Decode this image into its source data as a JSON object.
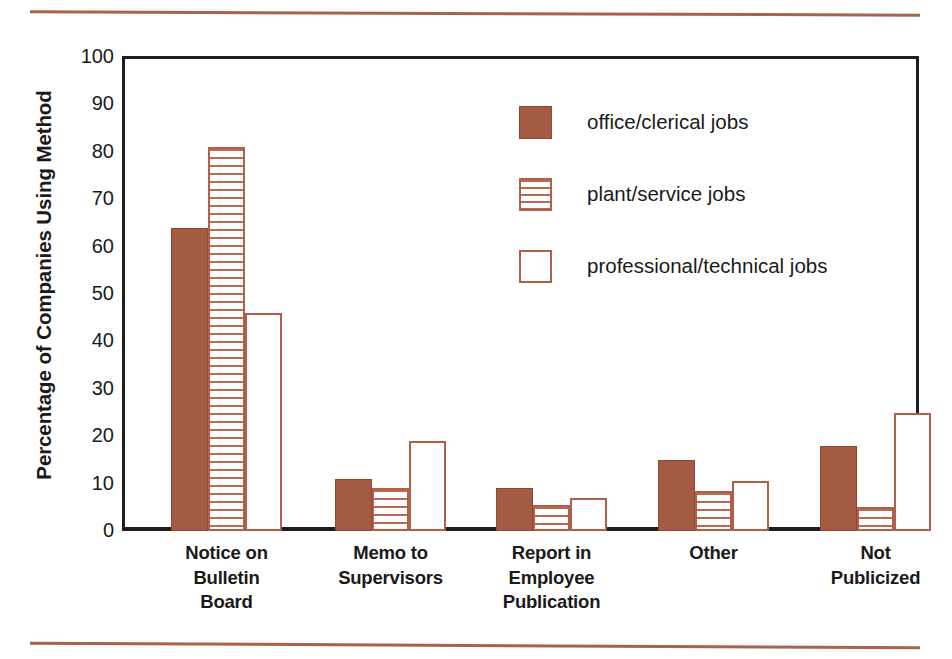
{
  "chart_data": {
    "type": "bar",
    "title": "",
    "xlabel": "",
    "ylabel": "Percentage of Companies Using Method",
    "ylim": [
      0,
      100
    ],
    "yticks": [
      0,
      10,
      20,
      30,
      40,
      50,
      60,
      70,
      80,
      90,
      100
    ],
    "grid": false,
    "legend_position": "inside-top-center",
    "categories": [
      "Notice on Bulletin Board",
      "Memo to Supervisors",
      "Report in Employee Publication",
      "Other",
      "Not Publicized"
    ],
    "category_lines": [
      [
        "Notice on",
        "Bulletin",
        "Board"
      ],
      [
        "Memo to",
        "Supervisors"
      ],
      [
        "Report in",
        "Employee",
        "Publication"
      ],
      [
        "Other"
      ],
      [
        "Not",
        "Publicized"
      ]
    ],
    "series": [
      {
        "name": "office/clerical jobs",
        "style": "solid",
        "color": "#a55a43",
        "values": [
          64,
          11,
          9,
          15,
          18
        ]
      },
      {
        "name": "plant/service jobs",
        "style": "hatched",
        "color": "#b06048",
        "values": [
          81,
          9,
          5.5,
          8.5,
          5
        ]
      },
      {
        "name": "professional/technical jobs",
        "style": "open",
        "color": "#b06048",
        "values": [
          46,
          19,
          7,
          10.5,
          25
        ]
      }
    ]
  },
  "colors": {
    "accent_rule": "#a8624d",
    "axis": "#1d1d1d",
    "bar_solid": "#a55a43",
    "bar_outline": "#b06048",
    "text": "#1a1a1a"
  }
}
